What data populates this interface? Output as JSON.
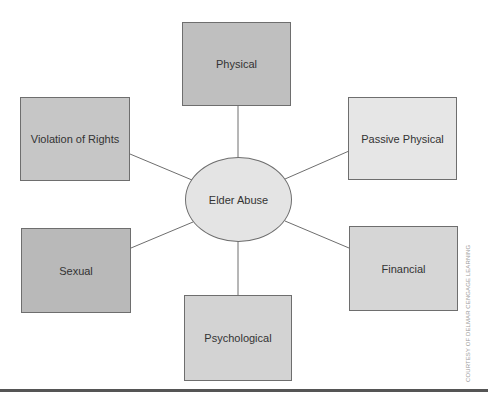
{
  "diagram": {
    "type": "hub-and-spoke concept map",
    "center": {
      "label": "Elder Abuse",
      "fill": "#e4e4e4"
    },
    "nodes": [
      {
        "id": "physical",
        "label": "Physical",
        "position": "top",
        "fill": "#bfbfbf"
      },
      {
        "id": "violation-of-rights",
        "label": "Violation of Rights",
        "position": "upper-left",
        "fill": "#c6c6c6"
      },
      {
        "id": "passive-physical",
        "label": "Passive Physical",
        "position": "upper-right",
        "fill": "#e6e6e6"
      },
      {
        "id": "sexual",
        "label": "Sexual",
        "position": "lower-left",
        "fill": "#b9b9b9"
      },
      {
        "id": "financial",
        "label": "Financial",
        "position": "lower-right",
        "fill": "#d6d6d6"
      },
      {
        "id": "psychological",
        "label": "Psychological",
        "position": "bottom",
        "fill": "#d3d3d3"
      }
    ],
    "edges": [
      {
        "from": "Elder Abuse",
        "to": "Physical"
      },
      {
        "from": "Elder Abuse",
        "to": "Violation of Rights"
      },
      {
        "from": "Elder Abuse",
        "to": "Passive Physical"
      },
      {
        "from": "Elder Abuse",
        "to": "Sexual"
      },
      {
        "from": "Elder Abuse",
        "to": "Financial"
      },
      {
        "from": "Elder Abuse",
        "to": "Psychological"
      }
    ],
    "line_color": "#6e6e6e",
    "border_color": "#6e6e6e"
  },
  "credit": "COURTESY OF DELMAR CENGAGE LEARNING"
}
